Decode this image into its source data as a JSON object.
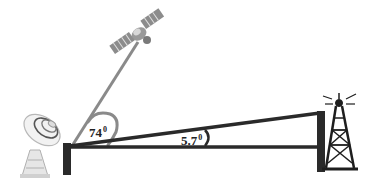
{
  "diagram": {
    "type": "satellite-vs-terrestrial-link-angles",
    "angles": [
      {
        "id": "satellite_elevation",
        "value": "74",
        "unit": "0"
      },
      {
        "id": "tower_elevation",
        "value": "5.7",
        "unit": "0"
      }
    ],
    "elements": {
      "satellite": "satellite-icon",
      "dish": "satellite-dish-icon",
      "tower": "radio-tower-icon"
    },
    "colors": {
      "structure": "#2a2a2a",
      "beam": "#8a8a8a",
      "background": "#ffffff"
    }
  }
}
